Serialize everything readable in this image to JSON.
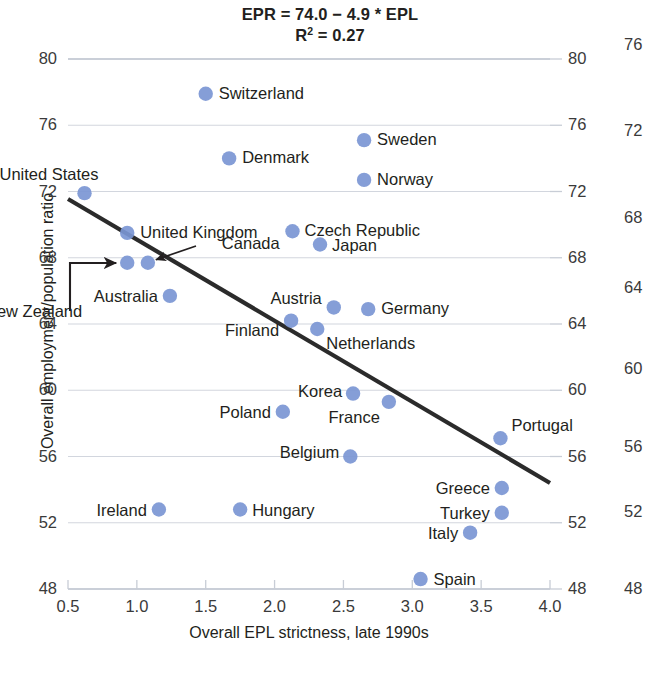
{
  "chart_data": {
    "type": "scatter",
    "title": "EPR = 74.0 − 4.9 * EPL",
    "subtitle_prefix": "R",
    "subtitle_sup": "2",
    "subtitle_suffix": " = 0.27",
    "xlabel": "Overall EPL strictness, late 1990s",
    "ylabel": "Overall employment/population ratio",
    "xlim": [
      0.5,
      4.0
    ],
    "ylim": [
      48,
      80
    ],
    "xticks": [
      "0.5",
      "1.0",
      "1.5",
      "2.0",
      "2.5",
      "3.0",
      "3.5",
      "4.0"
    ],
    "yticks_left": [
      "80",
      "76",
      "72",
      "68",
      "64",
      "60",
      "56",
      "52",
      "48"
    ],
    "yticks_right": [
      "80",
      "76",
      "72",
      "68",
      "64",
      "60",
      "56",
      "52",
      "48"
    ],
    "yticks_far_right": [
      "76",
      "72",
      "68",
      "64",
      "60",
      "56",
      "52",
      "48"
    ],
    "grid": true,
    "legend": "none",
    "marker_color": "#7b96d4",
    "line_color": "#2b2b2b",
    "grid_color": "#c8cdd6",
    "regression": {
      "intercept": 74.0,
      "slope": -4.9,
      "x_start": 0.5,
      "y_start": 71.55,
      "x_end": 4.0,
      "y_end": 54.4
    },
    "points": [
      {
        "label": "Switzerland",
        "x": 1.5,
        "y": 77.9
      },
      {
        "label": "Sweden",
        "x": 2.65,
        "y": 75.1
      },
      {
        "label": "Denmark",
        "x": 1.67,
        "y": 74.0
      },
      {
        "label": "Norway",
        "x": 2.65,
        "y": 72.7
      },
      {
        "label": "United States",
        "x": 0.62,
        "y": 71.9
      },
      {
        "label": "Czech Republic",
        "x": 2.13,
        "y": 69.6
      },
      {
        "label": "United Kingdom",
        "x": 0.93,
        "y": 69.5
      },
      {
        "label": "Japan",
        "x": 2.33,
        "y": 68.8
      },
      {
        "label": "New Zealand",
        "x": 0.93,
        "y": 67.7
      },
      {
        "label": "Canada",
        "x": 1.08,
        "y": 67.7
      },
      {
        "label": "Australia",
        "x": 1.24,
        "y": 65.7
      },
      {
        "label": "Germany",
        "x": 2.68,
        "y": 64.9
      },
      {
        "label": "Austria",
        "x": 2.43,
        "y": 65.0
      },
      {
        "label": "Finland",
        "x": 2.12,
        "y": 64.2
      },
      {
        "label": "Netherlands",
        "x": 2.31,
        "y": 63.7
      },
      {
        "label": "Korea",
        "x": 2.57,
        "y": 59.8
      },
      {
        "label": "France",
        "x": 2.83,
        "y": 59.3
      },
      {
        "label": "Poland",
        "x": 2.06,
        "y": 58.7
      },
      {
        "label": "Portugal",
        "x": 3.64,
        "y": 57.1
      },
      {
        "label": "Belgium",
        "x": 2.55,
        "y": 56.0
      },
      {
        "label": "Greece",
        "x": 3.65,
        "y": 54.1
      },
      {
        "label": "Ireland",
        "x": 1.16,
        "y": 52.8
      },
      {
        "label": "Hungary",
        "x": 1.75,
        "y": 52.8
      },
      {
        "label": "Turkey",
        "x": 3.65,
        "y": 52.6
      },
      {
        "label": "Italy",
        "x": 3.42,
        "y": 51.4
      },
      {
        "label": "Spain",
        "x": 3.06,
        "y": 48.6
      }
    ],
    "annotations": [
      {
        "name": "new-zealand-leader",
        "note": "elbow arrow from New Zealand label to its marker"
      },
      {
        "name": "canada-leader",
        "note": "diagonal arrow from Canada label to its marker"
      }
    ]
  }
}
